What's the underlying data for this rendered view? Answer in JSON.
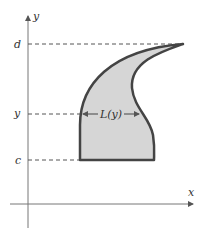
{
  "diagram": {
    "axes": {
      "x_label": "x",
      "y_label": "y"
    },
    "levels": {
      "top": "d",
      "middle": "y",
      "bottom": "c"
    },
    "width_label": "L(y)",
    "colors": {
      "fill": "#d6d6d6",
      "outline": "#444444",
      "axis": "#666666",
      "dashed": "#555555"
    }
  }
}
